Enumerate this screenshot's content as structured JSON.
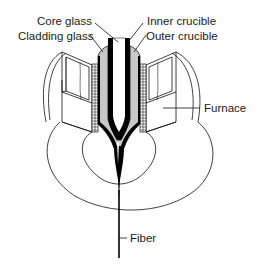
{
  "diagram": {
    "labels": {
      "core_glass": "Core glass",
      "cladding_glass": "Cladding glass",
      "inner_crucible": "Inner crucible",
      "outer_crucible": "Outer crucible",
      "furnace": "Furnace",
      "fiber": "Fiber"
    },
    "colors": {
      "background": "#ffffff",
      "line": "#111111",
      "cladding_fill": "#c8c8c8",
      "crucible_wall": "#000000"
    }
  }
}
